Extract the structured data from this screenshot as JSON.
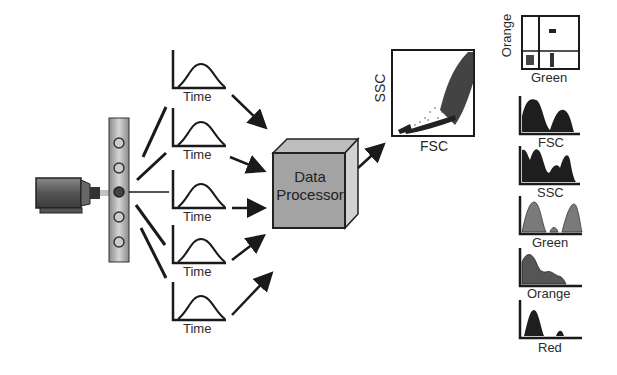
{
  "diagram": {
    "title": "",
    "laser": {
      "label": ""
    },
    "flow_cell": {
      "cell_count": 5
    },
    "pulse_plots": [
      {
        "xlabel": "Time"
      },
      {
        "xlabel": "Time"
      },
      {
        "xlabel": "Time"
      },
      {
        "xlabel": "Time"
      },
      {
        "xlabel": "Time"
      }
    ],
    "processor": {
      "line1": "Data",
      "line2": "Processor"
    },
    "scatter": {
      "xlabel": "FSC",
      "ylabel": "SSC"
    },
    "quadrant": {
      "xlabel": "Green",
      "ylabel": "Orange"
    },
    "histograms": [
      {
        "label": "FSC"
      },
      {
        "label": "SSC"
      },
      {
        "label": "Green"
      },
      {
        "label": "Orange"
      },
      {
        "label": "Red"
      }
    ],
    "colors": {
      "line": "#1a1a1a",
      "box_fill": "#9a9a9a",
      "tube": "#b5b5b5",
      "hist_dark": "#1e1e1e",
      "hist_gray": "#7a7a7a"
    }
  }
}
